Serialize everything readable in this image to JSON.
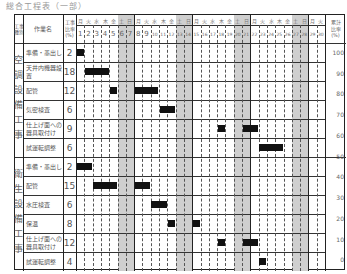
{
  "title": "総合工程表（一部）",
  "header": {
    "category": "工事\n種別",
    "task": "作業名",
    "ratio": "工事\n比率\n(%)",
    "cumulative": "累計\n比率\n(%)"
  },
  "days": {
    "count": 30,
    "weekdays": [
      "月",
      "火",
      "水",
      "木",
      "金",
      "土",
      "日",
      "月",
      "火",
      "水",
      "木",
      "金",
      "土",
      "日",
      "月",
      "火",
      "水",
      "木",
      "金",
      "土",
      "日",
      "月",
      "火",
      "水",
      "木",
      "金",
      "土",
      "日",
      "月",
      "火"
    ],
    "shaded": [
      6,
      7,
      13,
      14,
      20,
      21,
      27,
      28
    ]
  },
  "sections": [
    {
      "name": "空調設備工事",
      "tasks": [
        {
          "name": "準備・墨出し",
          "ratio": "2",
          "bars": [
            [
              1,
              1
            ]
          ]
        },
        {
          "name": "天井内機器設置",
          "ratio": "18",
          "bars": [
            [
              2,
              4
            ]
          ]
        },
        {
          "name": "配管",
          "ratio": "12",
          "bars": [
            [
              5,
              5
            ],
            [
              8,
              10
            ]
          ]
        },
        {
          "name": "気密検査",
          "ratio": "6",
          "bars": [
            [
              11,
              12
            ]
          ]
        },
        {
          "name": "仕上げ面への器具取付け",
          "ratio": "9",
          "bars": [
            [
              18,
              18
            ],
            [
              21,
              22
            ]
          ]
        },
        {
          "name": "試運転調整",
          "ratio": "6",
          "bars": [
            [
              23,
              25
            ]
          ]
        }
      ]
    },
    {
      "name": "衛生設備工事",
      "tasks": [
        {
          "name": "準備・墨出し",
          "ratio": "2",
          "bars": [
            [
              1,
              2
            ]
          ]
        },
        {
          "name": "配管",
          "ratio": "15",
          "bars": [
            [
              3,
              5
            ],
            [
              8,
              9
            ]
          ]
        },
        {
          "name": "水圧検査",
          "ratio": "6",
          "bars": [
            [
              10,
              11
            ]
          ]
        },
        {
          "name": "保温",
          "ratio": "8",
          "bars": [
            [
              12,
              12
            ],
            [
              15,
              15
            ]
          ]
        },
        {
          "name": "仕上げ面への器具取付け",
          "ratio": "12",
          "bars": [
            [
              18,
              18
            ],
            [
              21,
              22
            ]
          ]
        },
        {
          "name": "試運転調整",
          "ratio": "4",
          "bars": [
            [
              23,
              23
            ]
          ]
        }
      ]
    }
  ],
  "chart_data": {
    "type": "table",
    "title": "総合工程表（一部）",
    "xlabel": "日",
    "ylabel": "累計比率 (%)",
    "x": [
      1,
      2,
      3,
      4,
      5,
      6,
      7,
      8,
      9,
      10,
      11,
      12,
      13,
      14,
      15,
      16,
      17,
      18,
      19,
      20,
      21,
      22,
      23,
      24,
      25,
      26,
      27,
      28,
      29,
      30
    ],
    "right_axis_ticks": [
      100,
      90,
      80,
      70,
      60,
      50,
      40,
      30,
      20,
      10,
      0
    ],
    "ylim": [
      0,
      100
    ],
    "columns": [
      "工事種別",
      "作業名",
      "工事比率(%)",
      "作業期間（日）"
    ],
    "rows": [
      [
        "空調設備工事",
        "準備・墨出し",
        2,
        "1"
      ],
      [
        "空調設備工事",
        "天井内機器設置",
        18,
        "2-4"
      ],
      [
        "空調設備工事",
        "配管",
        12,
        "5, 8-10"
      ],
      [
        "空調設備工事",
        "気密検査",
        6,
        "11-12"
      ],
      [
        "空調設備工事",
        "仕上げ面への器具取付け",
        9,
        "18, 21-22"
      ],
      [
        "空調設備工事",
        "試運転調整",
        6,
        "23-25"
      ],
      [
        "衛生設備工事",
        "準備・墨出し",
        2,
        "1-2"
      ],
      [
        "衛生設備工事",
        "配管",
        15,
        "3-5, 8-9"
      ],
      [
        "衛生設備工事",
        "水圧検査",
        6,
        "10-11"
      ],
      [
        "衛生設備工事",
        "保温",
        8,
        "12, 15"
      ],
      [
        "衛生設備工事",
        "仕上げ面への器具取付け",
        12,
        "18, 21-22"
      ],
      [
        "衛生設備工事",
        "試運転調整",
        4,
        "23"
      ]
    ],
    "shaded_days": [
      6,
      7,
      13,
      14,
      20,
      21,
      27,
      28
    ],
    "grid": true
  }
}
